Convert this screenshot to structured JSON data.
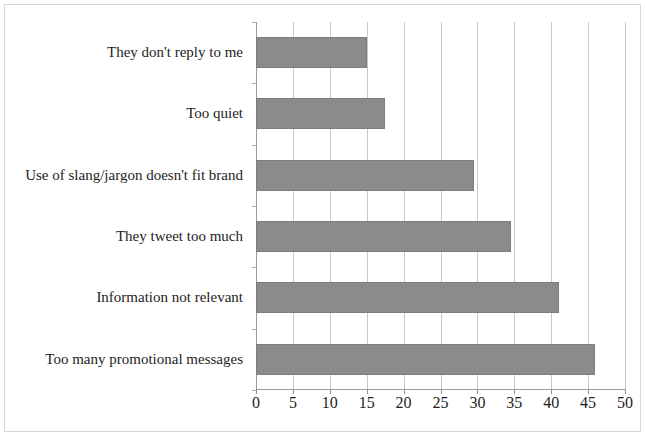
{
  "chart_data": {
    "type": "bar",
    "orientation": "horizontal",
    "title": "",
    "subtitle": "",
    "xlabel": "",
    "ylabel": "",
    "xlim": [
      0,
      50
    ],
    "xticks": [
      0,
      5,
      10,
      15,
      20,
      25,
      30,
      35,
      40,
      45,
      50
    ],
    "xtick_labels": [
      "0",
      "5",
      "10",
      "15",
      "20",
      "25",
      "30",
      "35",
      "40",
      "45",
      "50"
    ],
    "grid": "vertical",
    "legend": "none",
    "bar_color": "#8b8b8b",
    "bar_edge_color": "#7d7d7d",
    "background_color": "#ffffff",
    "axis_color": "#9a9a9a",
    "gridline_color": "#c9c9c9",
    "categories": [
      "They don't reply to me",
      "Too quiet",
      "Use of slang/jargon doesn't fit brand",
      "They tweet too much",
      "Information not relevant",
      "Too many promotional messages"
    ],
    "values": [
      15,
      17.5,
      29.5,
      34.5,
      41,
      46
    ],
    "series": [
      {
        "name": "",
        "values": [
          15,
          17.5,
          29.5,
          34.5,
          41,
          46
        ]
      }
    ]
  }
}
